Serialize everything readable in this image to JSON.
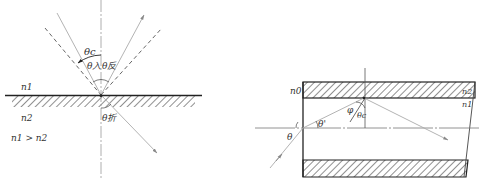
{
  "left_diagram": {
    "title": "Total internal reflection at interface",
    "labels": {
      "theta_c": "θc",
      "theta_in": "θ入",
      "theta_reflect": "θ反",
      "theta_refract": "θ折",
      "n1": "n1",
      "n2": "n2",
      "condition": "n1 > n2"
    }
  },
  "right_diagram": {
    "title": "Optical fiber light guiding",
    "labels": {
      "n0": "n0",
      "n1": "n1",
      "n2": "n2",
      "theta": "θ",
      "theta_prime": "θ'",
      "phi": "φ",
      "theta_c": "θc"
    }
  },
  "colors": {
    "line": "#333333",
    "ray": "#9a9a9a",
    "hatch": "#333333"
  }
}
